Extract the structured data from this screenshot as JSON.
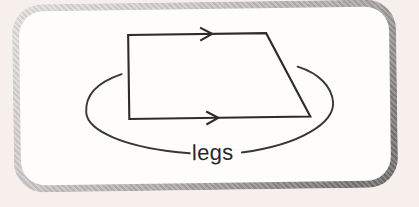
{
  "scene": {
    "description": "Scanned textbook callout box: trapezoid with arrow marks on the two parallel bases and an oval loop labeling the two non-parallel sides as legs"
  },
  "colors": {
    "page_background": "#f7efeb",
    "frame_light": "#e3e1e0",
    "frame_dark": "#6d6b6a",
    "box_fill": "#fefdfc",
    "ink": "#2e2c2b"
  },
  "diagram": {
    "label": "legs",
    "trapezoid_points": "129,34 267,34 310,118 129,118",
    "top_arrow_path": "M 201 27.5 L 213 34 L 201 40.5",
    "bottom_arrow_path": "M 206 111.5 L 218 118 L 206 124.5",
    "left_arc_path": "M 122 73 C 97 81, 85 94, 86 111 C 87 129, 124 147, 189 153",
    "right_arc_path": "M 298 68 C 319 75, 332 88, 333 104 C 334 124, 301 146, 241 153"
  }
}
